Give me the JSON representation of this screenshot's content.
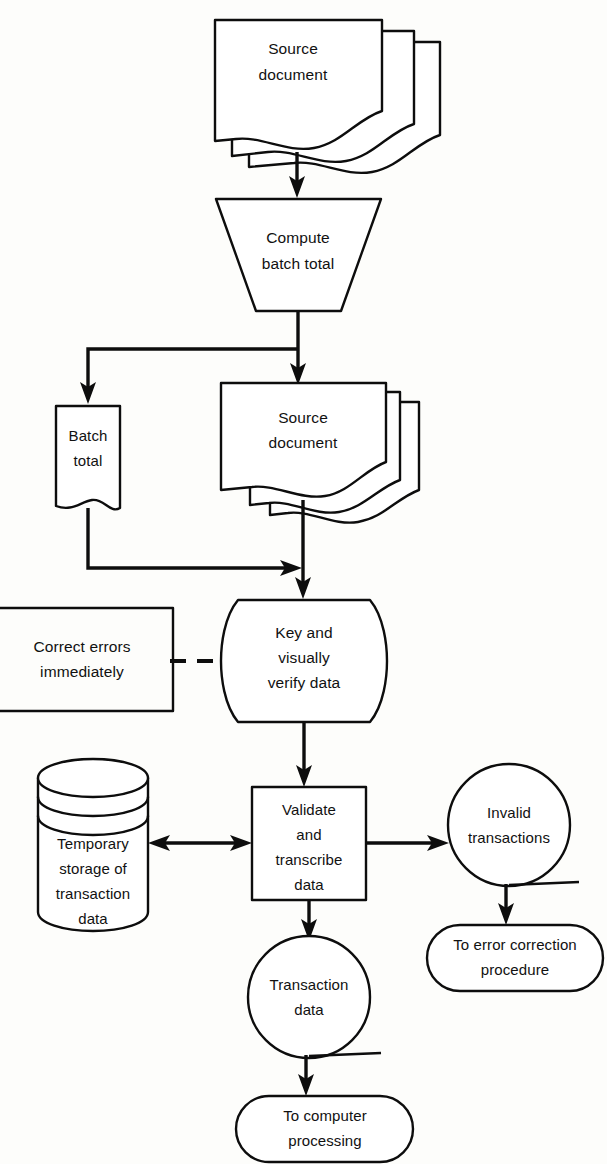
{
  "diagram": {
    "background_color": "#fdfdfb",
    "line_color": "#0d0d0d",
    "shape_fill": "#ffffff"
  },
  "nodes": {
    "source_document_top": {
      "shape": "document-stack",
      "line1": "Source",
      "line2": "document"
    },
    "compute_batch_total": {
      "shape": "trapezoid-manual-operation",
      "line1": "Compute",
      "line2": "batch total"
    },
    "batch_total": {
      "shape": "document",
      "line1": "Batch",
      "line2": "total"
    },
    "source_document_second": {
      "shape": "document-stack",
      "line1": "Source",
      "line2": "document"
    },
    "correct_errors": {
      "shape": "open-annotation-box",
      "line1": "Correct errors",
      "line2": "immediately"
    },
    "key_and_verify": {
      "shape": "manual-input-curved",
      "line1": "Key and",
      "line2": "visually",
      "line3": "verify data"
    },
    "temporary_storage": {
      "shape": "cylinder-stacked-disks",
      "line1": "Temporary",
      "line2": "storage of",
      "line3": "transaction",
      "line4": "data"
    },
    "validate_and_transcribe": {
      "shape": "rectangle-process",
      "line1": "Validate",
      "line2": "and",
      "line3": "transcribe",
      "line4": "data"
    },
    "invalid_transactions": {
      "shape": "circle-connector",
      "line1": "Invalid",
      "line2": "transactions"
    },
    "to_error_correction": {
      "shape": "stadium-terminator",
      "line1": "To error correction",
      "line2": "procedure"
    },
    "transaction_data": {
      "shape": "circle-connector",
      "line1": "Transaction",
      "line2": "data"
    },
    "to_computer_processing": {
      "shape": "stadium-terminator",
      "line1": "To computer",
      "line2": "processing"
    }
  },
  "connectors": [
    {
      "id": "source-to-compute",
      "from": "source_document_top",
      "to": "compute_batch_total",
      "style": "solid",
      "arrows": "end"
    },
    {
      "id": "compute-to-split",
      "from": "compute_batch_total",
      "to": "split-junction",
      "style": "solid",
      "arrows": "none"
    },
    {
      "id": "split-to-batch-total",
      "from": "split-junction",
      "to": "batch_total",
      "style": "solid",
      "arrows": "end"
    },
    {
      "id": "split-to-source-document-second",
      "from": "split-junction",
      "to": "source_document_second",
      "style": "solid",
      "arrows": "end"
    },
    {
      "id": "batch-total-to-merge",
      "from": "batch_total",
      "to": "merge-junction",
      "style": "solid",
      "arrows": "end"
    },
    {
      "id": "source-document-second-to-key-verify",
      "from": "source_document_second",
      "to": "key_and_verify",
      "style": "solid",
      "arrows": "end"
    },
    {
      "id": "correct-errors-to-key-verify",
      "from": "correct_errors",
      "to": "key_and_verify",
      "style": "dashed",
      "arrows": "none"
    },
    {
      "id": "key-verify-to-validate",
      "from": "key_and_verify",
      "to": "validate_and_transcribe",
      "style": "solid",
      "arrows": "end"
    },
    {
      "id": "validate-to-storage",
      "from": "validate_and_transcribe",
      "to": "temporary_storage",
      "style": "solid",
      "arrows": "both"
    },
    {
      "id": "validate-to-invalid",
      "from": "validate_and_transcribe",
      "to": "invalid_transactions",
      "style": "solid",
      "arrows": "end"
    },
    {
      "id": "validate-to-transaction-data",
      "from": "validate_and_transcribe",
      "to": "transaction_data",
      "style": "solid",
      "arrows": "end"
    },
    {
      "id": "invalid-to-error-correction",
      "from": "invalid_transactions",
      "to": "to_error_correction",
      "style": "solid",
      "arrows": "end"
    },
    {
      "id": "transaction-data-to-computer-processing",
      "from": "transaction_data",
      "to": "to_computer_processing",
      "style": "solid",
      "arrows": "end"
    }
  ]
}
